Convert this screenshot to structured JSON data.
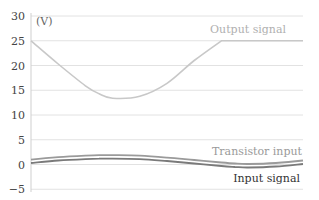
{
  "chart_data": {
    "type": "line",
    "title": "",
    "xlabel": "",
    "ylabel": "(V)",
    "ylim": [
      -5,
      30
    ],
    "yticks": [
      30,
      25,
      20,
      15,
      10,
      5,
      0,
      -5
    ],
    "grid": true,
    "legend_position": "inline labels",
    "x": [
      0,
      0.1,
      0.2,
      0.25,
      0.3,
      0.4,
      0.5,
      0.6,
      0.7,
      0.75,
      0.8,
      0.9,
      1.0
    ],
    "series": [
      {
        "name": "Output signal",
        "color": "#c8c8c8",
        "values": [
          25,
          20.3,
          15.9,
          14.3,
          13.4,
          13.8,
          16.4,
          21.0,
          25,
          25,
          25,
          25,
          25
        ]
      },
      {
        "name": "Transistor input",
        "color": "#9a9a9a",
        "values": [
          1.0,
          1.5,
          1.8,
          1.9,
          1.9,
          1.8,
          1.4,
          0.9,
          0.4,
          0.2,
          0.1,
          0.3,
          0.8
        ]
      },
      {
        "name": "Input signal",
        "color": "#7a7a7a",
        "values": [
          0.3,
          0.8,
          1.1,
          1.2,
          1.2,
          1.1,
          0.7,
          0.2,
          -0.3,
          -0.5,
          -0.6,
          -0.4,
          0.1
        ]
      }
    ],
    "annotations": [
      "Output signal",
      "Transistor input",
      "Input signal"
    ]
  },
  "labels": {
    "unit": "(V)",
    "output": "Output signal",
    "transistor": "Transistor input",
    "input": "Input signal"
  },
  "ticks": [
    "30",
    "25",
    "20",
    "15",
    "10",
    "5",
    "0",
    "−5"
  ]
}
